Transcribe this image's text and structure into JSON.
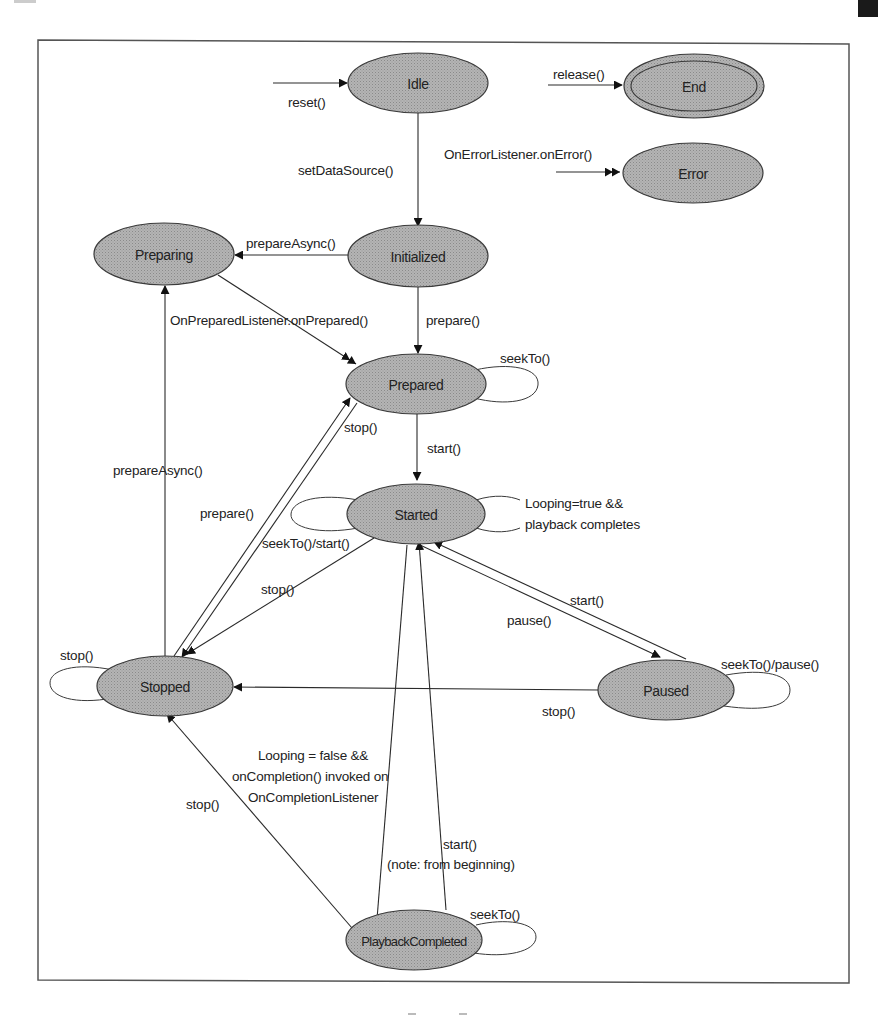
{
  "diagram": {
    "states": {
      "idle": "Idle",
      "end": "End",
      "error": "Error",
      "initialized": "Initialized",
      "preparing": "Preparing",
      "prepared": "Prepared",
      "started": "Started",
      "stopped": "Stopped",
      "paused": "Paused",
      "playback_completed": "PlaybackCompleted"
    },
    "transitions": {
      "reset": "reset()",
      "release": "release()",
      "on_error": "OnErrorListener.onError()",
      "set_data_source": "setDataSource()",
      "prepare_async_init": "prepareAsync()",
      "on_prepared": "OnPreparedListener.onPrepared()",
      "prepare_init": "prepare()",
      "seek_to_prepared": "seekTo()",
      "stop_prepared": "stop()",
      "start_prepared": "start()",
      "prepare_async_stopped": "prepareAsync()",
      "prepare_stopped": "prepare()",
      "seek_start_started": "seekTo()/start()",
      "looping_true_1": "Looping=true &&",
      "looping_true_2": "playback completes",
      "stop_started": "stop()",
      "start_paused": "start()",
      "pause_started": "pause()",
      "seek_pause_paused": "seekTo()/pause()",
      "stop_paused": "stop()",
      "stop_stopped": "stop()",
      "looping_false_1": "Looping = false &&",
      "looping_false_2": "onCompletion() invoked on",
      "looping_false_3": "OnCompletionListener",
      "start_completed_1": "start()",
      "start_completed_2": "(note: from beginning)",
      "stop_completed": "stop()",
      "seek_to_completed": "seekTo()"
    }
  }
}
